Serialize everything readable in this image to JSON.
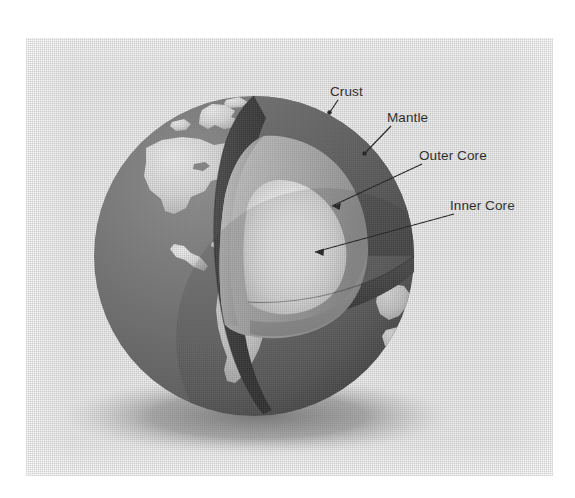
{
  "figure": {
    "plate_background": "#eeeeee",
    "page_background": "#ffffff"
  },
  "callouts": [
    {
      "id": "crust",
      "label": "Crust",
      "layer_color": "#6e6e6e"
    },
    {
      "id": "mantle",
      "label": "Mantle",
      "layer_color": "#585858"
    },
    {
      "id": "outer_core",
      "label": "Outer Core",
      "layer_color": "#b4b4b4"
    },
    {
      "id": "inner_core",
      "label": "Inner Core",
      "layer_color": "#fdfdfd"
    }
  ],
  "globe": {
    "ocean_color": "#6b6b6b",
    "land_color": "#e2e2e2",
    "cut_face_dark": "#3d3d3d",
    "cut_face_mid": "#8b8b8b",
    "shadow_color": "#9a9a9a",
    "leader_color": "#1d1d1d"
  }
}
